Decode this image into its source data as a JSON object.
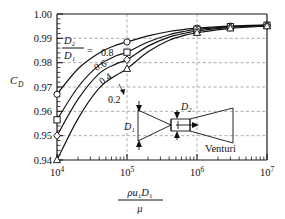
{
  "chart_data": {
    "type": "line",
    "title": "",
    "xlabel": "rho u1 D1 / mu",
    "ylabel": "C_D",
    "xscale": "log",
    "xlim": [
      10000,
      10000000
    ],
    "ylim": [
      0.94,
      1.0
    ],
    "yticks": [
      0.94,
      0.95,
      0.96,
      0.97,
      0.98,
      0.99,
      1.0
    ],
    "ytick_labels": [
      "0.94",
      "0.95",
      "0.96",
      "0.97",
      "0.98",
      "0.99",
      "1.00"
    ],
    "xticks": [
      10000,
      100000,
      1000000,
      10000000
    ],
    "xtick_labels": [
      "10⁴",
      "10⁵",
      "10⁶",
      "10⁷"
    ],
    "grid": true,
    "legend_position": "inline-curve-labels",
    "annotation_device": "Venturi",
    "ratio_label_numerator": "D₂",
    "ratio_label_denominator": "D₁",
    "ratio_label_equals": "=",
    "series": [
      {
        "name": "0.8",
        "label": "0.8",
        "marker": "circle",
        "x": [
          10000,
          20000,
          40000,
          70000,
          100000,
          200000,
          400000,
          700000,
          1000000,
          3000000,
          10000000
        ],
        "values": [
          0.967,
          0.9775,
          0.984,
          0.9872,
          0.9885,
          0.991,
          0.9928,
          0.9938,
          0.9942,
          0.995,
          0.9955
        ],
        "marker_x": [
          10000,
          100000,
          1000000,
          3000000,
          10000000
        ],
        "marker_y": [
          0.967,
          0.9885,
          0.9942,
          0.995,
          0.9955
        ]
      },
      {
        "name": "0.6",
        "label": "0.6",
        "marker": "square",
        "x": [
          10000,
          20000,
          40000,
          70000,
          100000,
          200000,
          400000,
          700000,
          1000000,
          3000000,
          10000000
        ],
        "values": [
          0.9565,
          0.97,
          0.979,
          0.9828,
          0.9843,
          0.9885,
          0.9915,
          0.993,
          0.9937,
          0.9948,
          0.9954
        ],
        "marker_x": [
          10000,
          100000,
          1000000,
          3000000,
          10000000
        ],
        "marker_y": [
          0.9565,
          0.9843,
          0.9937,
          0.9948,
          0.9954
        ]
      },
      {
        "name": "0.4",
        "label": "0.4",
        "marker": "diamond",
        "x": [
          10000,
          20000,
          40000,
          70000,
          100000,
          200000,
          400000,
          700000,
          1000000,
          3000000,
          10000000
        ],
        "values": [
          0.95,
          0.965,
          0.9755,
          0.9795,
          0.9812,
          0.9868,
          0.9905,
          0.9922,
          0.993,
          0.9945,
          0.9952
        ],
        "marker_x": [
          10000,
          100000,
          1000000,
          3000000,
          10000000
        ],
        "marker_y": [
          0.95,
          0.9812,
          0.993,
          0.9945,
          0.9952
        ]
      },
      {
        "name": "0.2",
        "label": "0.2",
        "marker": "triangle",
        "x": [
          10000,
          20000,
          40000,
          70000,
          100000,
          200000,
          400000,
          700000,
          1000000,
          3000000,
          10000000
        ],
        "values": [
          0.94,
          0.957,
          0.9695,
          0.9748,
          0.9775,
          0.9845,
          0.9892,
          0.9914,
          0.9923,
          0.9941,
          0.995
        ],
        "marker_x": [
          10000,
          100000,
          1000000,
          3000000,
          10000000
        ],
        "marker_y": [
          0.94,
          0.9775,
          0.9923,
          0.9941,
          0.995
        ]
      }
    ]
  },
  "diagram": {
    "label_d1": "D₁",
    "label_d2": "D₂",
    "caption": "Venturi"
  },
  "axis_label": {
    "y": "C",
    "y_sub": "D",
    "x_num_rho": "ρ",
    "x_num_u": "u",
    "x_num_u_sub": "1",
    "x_num_d": "D",
    "x_num_d_sub": "1",
    "x_den": "μ"
  },
  "colors": {
    "axis": "#1a1a1a",
    "grid": "#8a8a8a",
    "curve": "#111111",
    "marker_fill": "#ffffff",
    "background": "#ffffff"
  }
}
